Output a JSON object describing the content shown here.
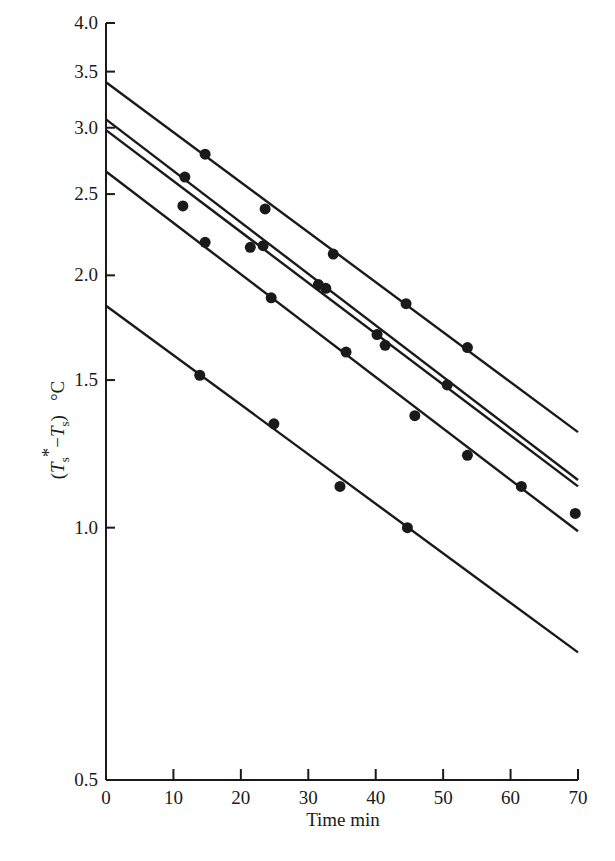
{
  "chart_data": {
    "type": "line",
    "title": "",
    "xlabel": "Time min",
    "ylabel": "(T*s − Ts)  °C",
    "yscale": "log",
    "xlim": [
      0,
      70
    ],
    "ylim": [
      0.5,
      4.0
    ],
    "grid": false,
    "legend": null,
    "x_ticks": [
      0,
      10,
      20,
      30,
      40,
      50,
      60,
      70
    ],
    "x_tick_labels": [
      "0",
      "10",
      "20",
      "30",
      "40",
      "50",
      "60",
      "70"
    ],
    "y_ticks": [
      0.5,
      1.0,
      1.5,
      2.0,
      2.5,
      3.0,
      3.5,
      4.0
    ],
    "y_tick_labels": [
      "0.5",
      "1.0",
      "1.5",
      "2.0",
      "2.5",
      "3.0",
      "3.5",
      "4.0"
    ],
    "series": [
      {
        "name": "run 1",
        "fit_line": {
          "x": [
            0,
            70
          ],
          "y": [
            3.4,
            1.3
          ]
        },
        "points": [
          [
            14.7,
            2.79
          ],
          [
            23.6,
            2.4
          ],
          [
            33.7,
            2.12
          ],
          [
            44.5,
            1.85
          ],
          [
            53.6,
            1.64
          ]
        ]
      },
      {
        "name": "run 2",
        "fit_line": {
          "x": [
            0,
            70
          ],
          "y": [
            3.07,
            1.14
          ]
        },
        "points": [
          [
            11.7,
            2.62
          ],
          [
            23.3,
            2.17
          ],
          [
            32.6,
            1.93
          ],
          [
            41.4,
            1.65
          ]
        ]
      },
      {
        "name": "run 3",
        "fit_line": {
          "x": [
            0,
            70
          ],
          "y": [
            2.98,
            1.12
          ]
        },
        "points": [
          [
            11.4,
            2.42
          ],
          [
            21.4,
            2.16
          ],
          [
            31.5,
            1.95
          ],
          [
            40.2,
            1.7
          ],
          [
            50.6,
            1.48
          ]
        ]
      },
      {
        "name": "run 4",
        "fit_line": {
          "x": [
            0,
            70
          ],
          "y": [
            2.66,
            0.99
          ]
        },
        "points": [
          [
            14.7,
            2.19
          ],
          [
            24.5,
            1.88
          ],
          [
            35.6,
            1.62
          ],
          [
            45.8,
            1.36
          ],
          [
            53.6,
            1.22
          ],
          [
            61.6,
            1.12
          ],
          [
            69.6,
            1.04
          ]
        ]
      },
      {
        "name": "run 5",
        "fit_line": {
          "x": [
            0,
            70
          ],
          "y": [
            1.84,
            0.71
          ]
        },
        "points": [
          [
            13.9,
            1.52
          ],
          [
            24.9,
            1.33
          ],
          [
            34.7,
            1.12
          ],
          [
            44.7,
            1.0
          ]
        ]
      }
    ]
  },
  "style": {
    "ink": "#1a1a1a",
    "background": "#ffffff"
  }
}
